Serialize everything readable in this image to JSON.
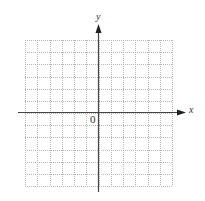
{
  "diagram": {
    "type": "coordinate-grid",
    "x_axis_label": "x",
    "y_axis_label": "y",
    "origin_label": "0",
    "grid": {
      "columns": 12,
      "rows": 12,
      "left": 25,
      "top": 40,
      "right": 172,
      "bottom": 186,
      "line_style": "dotted",
      "line_color": "#b8b8b8"
    },
    "axes": {
      "color": "#444444",
      "origin_px": [
        98,
        112
      ],
      "x_axis_start": 18,
      "x_axis_end": 186,
      "y_axis_start": 24,
      "y_axis_end": 192
    }
  }
}
